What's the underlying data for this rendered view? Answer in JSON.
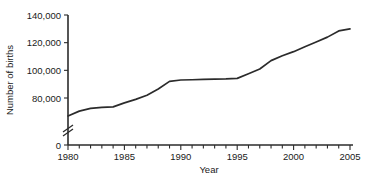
{
  "chart_data": {
    "type": "line",
    "title": "",
    "xlabel": "Year",
    "ylabel": "Number of births",
    "xlim": [
      1980,
      2005
    ],
    "ylim": [
      0,
      140000
    ],
    "y_axis_break": true,
    "y_axis_break_note": "axis broken between 0 and ~70,000",
    "grid": false,
    "legend": false,
    "x_tick_labels": [
      "1980",
      "1985",
      "1990",
      "1995",
      "2000",
      "2005"
    ],
    "x_major_ticks": [
      1980,
      1985,
      1990,
      1995,
      2000,
      2005
    ],
    "x_minor_tick_interval": 1,
    "y_tick_labels": [
      "0",
      "80,000",
      "100,000",
      "120,000",
      "140,000"
    ],
    "y_major_ticks": [
      0,
      80000,
      100000,
      120000,
      140000
    ],
    "x": [
      1980,
      1981,
      1982,
      1983,
      1984,
      1985,
      1986,
      1987,
      1988,
      1989,
      1990,
      1991,
      1992,
      1993,
      1994,
      1995,
      1996,
      1997,
      1998,
      1999,
      2000,
      2001,
      2002,
      2003,
      2004,
      2005
    ],
    "values": [
      67000,
      70500,
      72500,
      73200,
      73600,
      76500,
      79000,
      82000,
      86500,
      92000,
      93000,
      93200,
      93400,
      93600,
      93800,
      94200,
      97500,
      101000,
      107000,
      110500,
      113500,
      117000,
      120500,
      124000,
      128500,
      130000
    ],
    "series": [
      {
        "name": "Number of births",
        "values": [
          67000,
          70500,
          72500,
          73200,
          73600,
          76500,
          79000,
          82000,
          86500,
          92000,
          93000,
          93200,
          93400,
          93600,
          93800,
          94200,
          97500,
          101000,
          107000,
          110500,
          113500,
          117000,
          120500,
          124000,
          128500,
          130000
        ]
      }
    ]
  }
}
